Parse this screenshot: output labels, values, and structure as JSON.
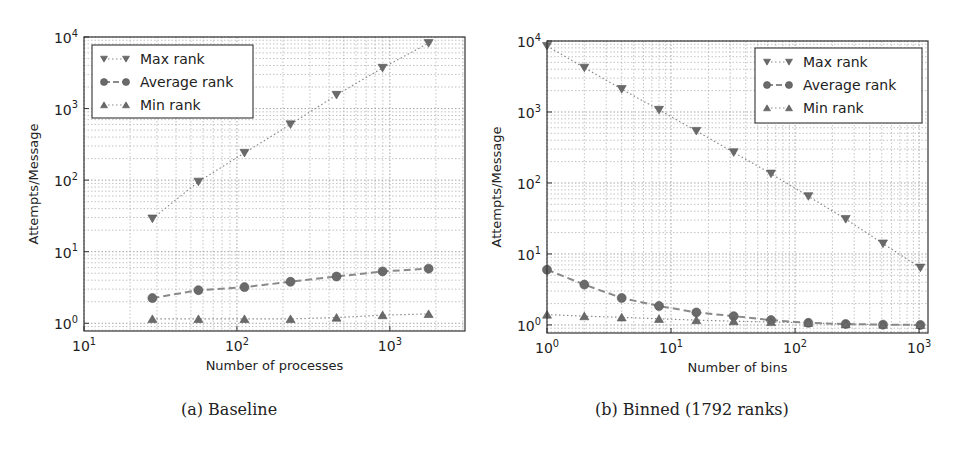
{
  "chart_data": [
    {
      "type": "line",
      "panel_id": "a",
      "caption": "(a) Baseline",
      "title": "",
      "xlabel": "Number of processes",
      "ylabel": "Attempts/Message",
      "xscale": "log",
      "yscale": "log",
      "xlim": [
        10,
        3100
      ],
      "ylim": [
        0.78,
        10000
      ],
      "xticks": [
        10,
        100,
        1000
      ],
      "xtick_labels": [
        "10^1",
        "10^2",
        "10^3"
      ],
      "yticks": [
        1,
        10,
        100,
        1000,
        10000
      ],
      "ytick_labels": [
        "10^0",
        "10^1",
        "10^2",
        "10^3",
        "10^4"
      ],
      "grid": true,
      "legend_position": "upper left",
      "x": [
        28,
        56,
        112,
        224,
        448,
        896,
        1792
      ],
      "series": [
        {
          "name": "Max rank",
          "marker": "triangle-down",
          "linestyle": "dotted",
          "values": [
            29,
            95,
            240,
            600,
            1550,
            3700,
            8200
          ]
        },
        {
          "name": "Average rank",
          "marker": "circle",
          "linestyle": "dashed",
          "values": [
            2.25,
            2.9,
            3.2,
            3.8,
            4.5,
            5.3,
            5.8
          ]
        },
        {
          "name": "Min rank",
          "marker": "triangle-up",
          "linestyle": "dotted",
          "values": [
            1.15,
            1.15,
            1.15,
            1.15,
            1.2,
            1.3,
            1.35
          ]
        }
      ]
    },
    {
      "type": "line",
      "panel_id": "b",
      "caption": "(b) Binned (1792 ranks)",
      "title": "",
      "xlabel": "Number of bins",
      "ylabel": "Attempts/Message",
      "xscale": "log",
      "yscale": "log",
      "xlim": [
        1,
        1180
      ],
      "ylim": [
        0.77,
        10000
      ],
      "xticks": [
        1,
        10,
        100,
        1000
      ],
      "xtick_labels": [
        "10^0",
        "10^1",
        "10^2",
        "10^3"
      ],
      "yticks": [
        1,
        10,
        100,
        1000,
        10000
      ],
      "ytick_labels": [
        "10^0",
        "10^1",
        "10^2",
        "10^3",
        "10^4"
      ],
      "grid": true,
      "legend_position": "upper right",
      "x": [
        1,
        2,
        4,
        8,
        16,
        32,
        64,
        128,
        256,
        512,
        1024
      ],
      "series": [
        {
          "name": "Max rank",
          "marker": "triangle-down",
          "linestyle": "dotted",
          "values": [
            8500,
            4200,
            2100,
            1070,
            540,
            270,
            135,
            65,
            31,
            14,
            6.4
          ]
        },
        {
          "name": "Average rank",
          "marker": "circle",
          "linestyle": "dashed",
          "values": [
            6.0,
            3.7,
            2.4,
            1.85,
            1.5,
            1.33,
            1.17,
            1.07,
            1.03,
            1.01,
            1.0
          ]
        },
        {
          "name": "Min rank",
          "marker": "triangle-up",
          "linestyle": "dotted",
          "values": [
            1.4,
            1.33,
            1.28,
            1.22,
            1.17,
            1.13,
            1.1,
            1.07,
            1.03,
            1.01,
            1.0
          ]
        }
      ]
    }
  ],
  "captions": {
    "a": "(a) Baseline",
    "b": "(b) Binned (1792 ranks)"
  },
  "colors": {
    "marker": "#6a6a6a",
    "line": "#8a8a8a",
    "grid": "#9a9a9a",
    "axis": "#333333",
    "text": "#222222"
  }
}
